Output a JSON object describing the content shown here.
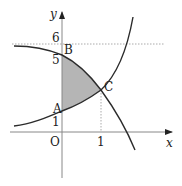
{
  "figure": {
    "axis_labels": {
      "x": "x",
      "y": "y",
      "origin": "O"
    },
    "ticks": {
      "x": [
        "1"
      ],
      "y": [
        "1",
        "5",
        "6"
      ]
    },
    "points": {
      "A": "A",
      "B": "B",
      "C": "C"
    },
    "colors": {
      "curve": "#2b2b2b",
      "shade": "#b5b5b5",
      "axis": "#888888",
      "dotted": "#aaaaaa"
    }
  }
}
